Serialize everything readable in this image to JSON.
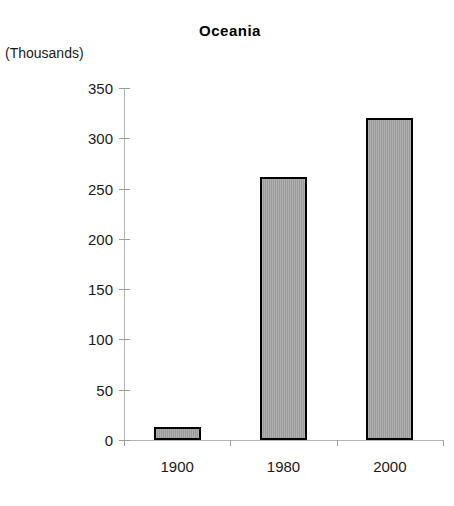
{
  "chart_data": {
    "type": "bar",
    "title": "Oceania",
    "xlabel": "",
    "ylabel": "(Thousands)",
    "categories": [
      "1900",
      "1980",
      "2000"
    ],
    "values": [
      13,
      262,
      320
    ],
    "ylim": [
      0,
      350
    ],
    "yticks": [
      0,
      50,
      100,
      150,
      200,
      250,
      300,
      350
    ],
    "ytick_labels": [
      "0",
      "50",
      "100",
      "150",
      "200",
      "250",
      "300",
      "350"
    ],
    "grid": false,
    "legend": null,
    "series": [
      {
        "name": "Oceania",
        "values": [
          13,
          262,
          320
        ]
      }
    ],
    "colors": {
      "bar_fill": "#9a9a9a",
      "bar_border": "#000000",
      "axis": "#b4b4b4",
      "text": "#1a1a1a",
      "background": "#ffffff"
    }
  }
}
